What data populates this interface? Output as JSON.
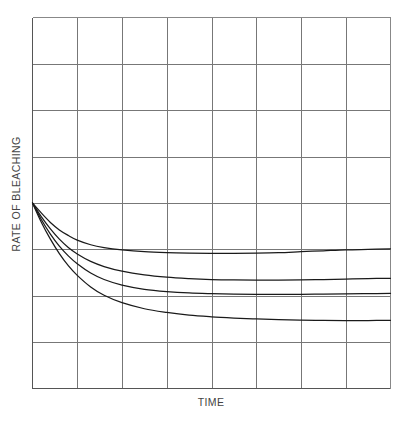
{
  "chart_data": {
    "type": "line",
    "title": "",
    "subtitle": "",
    "xlabel": "TIME",
    "ylabel": "RATE OF BLEACHING",
    "xlim": [
      0,
      8
    ],
    "ylim": [
      0,
      8
    ],
    "xticklabels": [],
    "yticklabels": [],
    "grid": true,
    "grid_color": "#777777",
    "grid_x_divisions": 8,
    "grid_y_divisions": 8,
    "legend": "none",
    "annotations": [],
    "line_color": "#1a1a1a",
    "series": [
      {
        "name": "curve-1",
        "comment": "highest asymptote; flattens near y=3 then slight rise",
        "x": [
          0.0,
          0.2,
          0.4,
          0.6,
          0.8,
          1.0,
          1.3,
          1.6,
          2.0,
          2.5,
          3.0,
          3.5,
          4.0,
          4.5,
          5.0,
          5.5,
          6.0,
          6.5,
          7.0,
          7.5,
          8.0
        ],
        "y": [
          4.0,
          3.78,
          3.58,
          3.42,
          3.3,
          3.2,
          3.1,
          3.04,
          2.99,
          2.95,
          2.93,
          2.92,
          2.915,
          2.915,
          2.92,
          2.93,
          2.95,
          2.97,
          2.99,
          3.0,
          3.01
        ]
      },
      {
        "name": "curve-2",
        "comment": "second highest asymptote near y=2.35",
        "x": [
          0.0,
          0.2,
          0.4,
          0.6,
          0.8,
          1.0,
          1.3,
          1.6,
          2.0,
          2.5,
          3.0,
          3.5,
          4.0,
          4.5,
          5.0,
          5.5,
          6.0,
          6.5,
          7.0,
          7.5,
          8.0
        ],
        "y": [
          4.0,
          3.7,
          3.44,
          3.22,
          3.04,
          2.9,
          2.74,
          2.63,
          2.53,
          2.45,
          2.4,
          2.37,
          2.35,
          2.34,
          2.335,
          2.335,
          2.34,
          2.35,
          2.36,
          2.37,
          2.375
        ]
      },
      {
        "name": "curve-3",
        "comment": "third curve; asymptote near y=2.02",
        "x": [
          0.0,
          0.2,
          0.4,
          0.6,
          0.8,
          1.0,
          1.3,
          1.6,
          2.0,
          2.5,
          3.0,
          3.5,
          4.0,
          4.5,
          5.0,
          5.5,
          6.0,
          6.5,
          7.0,
          7.5,
          8.0
        ],
        "y": [
          4.0,
          3.64,
          3.33,
          3.07,
          2.86,
          2.69,
          2.49,
          2.35,
          2.23,
          2.14,
          2.09,
          2.06,
          2.045,
          2.035,
          2.03,
          2.03,
          2.03,
          2.035,
          2.04,
          2.045,
          2.05
        ]
      },
      {
        "name": "curve-4",
        "comment": "lowest asymptote near y=1.45",
        "x": [
          0.0,
          0.2,
          0.4,
          0.6,
          0.8,
          1.0,
          1.3,
          1.6,
          2.0,
          2.5,
          3.0,
          3.5,
          4.0,
          4.5,
          5.0,
          5.5,
          6.0,
          6.5,
          7.0,
          7.5,
          8.0
        ],
        "y": [
          4.0,
          3.58,
          3.22,
          2.91,
          2.65,
          2.44,
          2.19,
          2.01,
          1.85,
          1.72,
          1.64,
          1.58,
          1.545,
          1.52,
          1.5,
          1.485,
          1.475,
          1.47,
          1.465,
          1.465,
          1.47
        ]
      }
    ]
  },
  "axes": {
    "x_axis_label": "TIME",
    "y_axis_label": "RATE OF BLEACHING"
  }
}
